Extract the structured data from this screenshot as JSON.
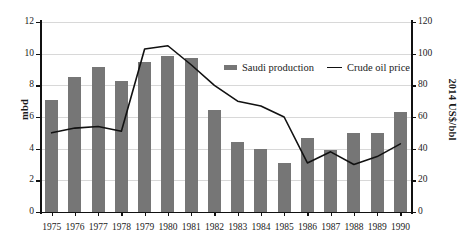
{
  "chart_data": {
    "type": "bar",
    "title": "",
    "subtitle": "",
    "xlabel": "",
    "ylabel": "mbd",
    "y2label": "2014 US$/bbl",
    "categories": [
      "1975",
      "1976",
      "1977",
      "1978",
      "1979",
      "1980",
      "1981",
      "1982",
      "1983",
      "1984",
      "1985",
      "1986",
      "1987",
      "1988",
      "1989",
      "1990"
    ],
    "ylim": [
      0,
      12
    ],
    "y2lim": [
      0,
      120
    ],
    "yticks": [
      0,
      2,
      4,
      6,
      8,
      10,
      12
    ],
    "y2ticks": [
      0,
      20,
      40,
      60,
      80,
      100,
      120
    ],
    "grid": true,
    "legend_position": "upper-center-right",
    "series": [
      {
        "name": "Saudi production",
        "type": "bar",
        "axis": "left",
        "unit": "mbd",
        "color": "#767676",
        "values": [
          7.05,
          8.55,
          9.15,
          8.25,
          9.5,
          9.85,
          9.75,
          6.45,
          4.45,
          4.0,
          3.1,
          4.7,
          3.9,
          5.0,
          5.0,
          6.3
        ]
      },
      {
        "name": "Crude oil price",
        "type": "line",
        "axis": "right",
        "unit": "2014 US$/bbl",
        "color": "#111111",
        "values": [
          50,
          53,
          54,
          51,
          103,
          105,
          93,
          80,
          70,
          67,
          60,
          31,
          38,
          30,
          35,
          43
        ]
      }
    ]
  },
  "axes": {
    "left": {
      "title": "mbd",
      "ticks": [
        "0",
        "2",
        "4",
        "6",
        "8",
        "10",
        "12"
      ]
    },
    "right": {
      "title": "2014 US$/bbl",
      "ticks": [
        "0",
        "20",
        "40",
        "60",
        "80",
        "100",
        "120"
      ]
    },
    "bottom": {
      "ticks": [
        "1975",
        "1976",
        "1977",
        "1978",
        "1979",
        "1980",
        "1981",
        "1982",
        "1983",
        "1984",
        "1985",
        "1986",
        "1987",
        "1988",
        "1989",
        "1990"
      ]
    }
  },
  "legend": {
    "items": [
      {
        "label": "Saudi production",
        "marker": "bar-swatch",
        "color": "#767676"
      },
      {
        "label": "Crude oil price",
        "marker": "line-swatch",
        "color": "#111111"
      }
    ]
  },
  "colors": {
    "bar": "#767676",
    "line": "#111111",
    "grid": "#d8d8d8",
    "axis": "#111111",
    "background": "#ffffff"
  }
}
